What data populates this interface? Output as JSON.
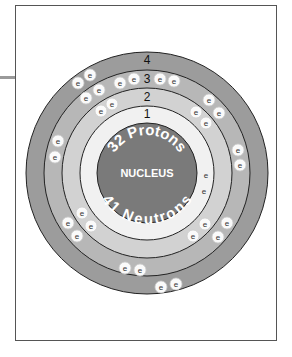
{
  "diagram": {
    "nucleus": {
      "label": "NUCLEUS",
      "protons_label": "32 Protons",
      "neutrons_label": "41 Neutrons",
      "color": "#7a7a7a"
    },
    "shells": [
      {
        "number": "1",
        "color": "#f1f1f1",
        "electrons": 2
      },
      {
        "number": "2",
        "color": "#d2d2d2",
        "electrons": 8
      },
      {
        "number": "3",
        "color": "#b7b7b7",
        "electrons": 18
      },
      {
        "number": "4",
        "color": "#9c9c9c",
        "electrons": 4
      }
    ],
    "electron_symbol": "e"
  }
}
